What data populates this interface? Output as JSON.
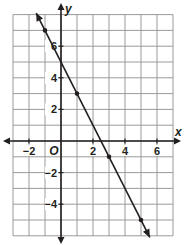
{
  "chart_data": {
    "type": "line",
    "title": "",
    "xlabel": "x",
    "ylabel": "y",
    "xlim": [
      -3,
      7
    ],
    "ylim": [
      -6,
      8
    ],
    "grid": true,
    "origin_label": "O",
    "x_tick_labels": [
      {
        "value": -2,
        "label": "−2"
      },
      {
        "value": 2,
        "label": "2"
      },
      {
        "value": 4,
        "label": "4"
      },
      {
        "value": 6,
        "label": "6"
      }
    ],
    "y_tick_labels": [
      {
        "value": 6,
        "label": "6"
      },
      {
        "value": 4,
        "label": "4"
      },
      {
        "value": 2,
        "label": "2"
      },
      {
        "value": -2,
        "label": "−2"
      },
      {
        "value": -4,
        "label": "−4"
      }
    ],
    "series": [
      {
        "name": "line",
        "equation": "y = -2x + 5",
        "points": [
          {
            "x": -1,
            "y": 7
          },
          {
            "x": 1,
            "y": 3
          },
          {
            "x": 3,
            "y": -1
          },
          {
            "x": 5,
            "y": -5
          }
        ],
        "arrows_both_ends": true
      }
    ]
  },
  "colors": {
    "grid": "#9a9a9a",
    "axis": "#231f20",
    "line": "#231f20"
  }
}
